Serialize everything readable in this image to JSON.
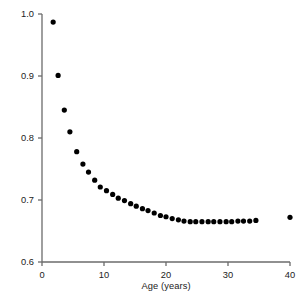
{
  "chart_data": {
    "type": "scatter",
    "title": "",
    "xlabel": "Age  (years)",
    "ylabel": "Production : biomass ratio (yr",
    "ylabel_superscript": "−1",
    "ylabel_suffix": ")",
    "xlim": [
      0,
      40
    ],
    "ylim": [
      0.6,
      1.0
    ],
    "xticks": [
      0,
      10,
      20,
      30,
      40
    ],
    "xtick_labels": [
      "0",
      "10",
      "20",
      "30",
      "40"
    ],
    "yticks": [
      0.6,
      0.7,
      0.8,
      0.9,
      1.0
    ],
    "ytick_labels": [
      "0.6",
      "0.7",
      "0.8",
      "0.9",
      "1.0"
    ],
    "grid": false,
    "legend": null,
    "marker": "filled-circle",
    "marker_color": "#000000",
    "marker_size_px": 5.2,
    "axis_color": "#6b6b6b",
    "x": [
      1.8,
      2.6,
      3.6,
      4.5,
      5.6,
      6.6,
      7.5,
      8.5,
      9.4,
      10.4,
      11.4,
      12.3,
      13.3,
      14.3,
      15.2,
      16.2,
      17.1,
      18.1,
      19.1,
      20.0,
      21.0,
      22.0,
      22.9,
      23.9,
      24.8,
      25.8,
      26.8,
      27.7,
      28.7,
      29.7,
      30.6,
      31.6,
      32.5,
      33.5,
      34.5,
      40.0
    ],
    "y": [
      0.987,
      0.901,
      0.845,
      0.81,
      0.778,
      0.758,
      0.745,
      0.732,
      0.721,
      0.715,
      0.709,
      0.703,
      0.699,
      0.694,
      0.69,
      0.686,
      0.683,
      0.679,
      0.675,
      0.673,
      0.67,
      0.668,
      0.666,
      0.665,
      0.665,
      0.665,
      0.665,
      0.665,
      0.665,
      0.665,
      0.665,
      0.666,
      0.666,
      0.666,
      0.667,
      0.672
    ],
    "n_points": 36
  },
  "axes": {
    "plot_left_px": 42,
    "plot_right_px": 290,
    "plot_top_px": 14,
    "plot_bottom_px": 262
  }
}
